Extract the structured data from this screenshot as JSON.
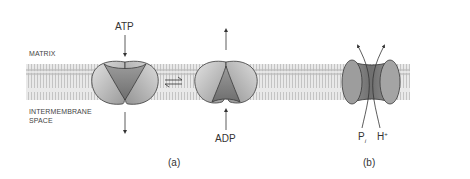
{
  "labels": {
    "matrix": "MATRIX",
    "intermembrane_line1": "INTERMEMBRANE",
    "intermembrane_line2": "SPACE",
    "atp": "ATP",
    "adp": "ADP",
    "pi_main": "P",
    "pi_sub": "i",
    "h_main": "H",
    "h_sup": "+",
    "panel_a": "(a)",
    "panel_b": "(b)"
  },
  "colors": {
    "membrane": "#cfcfcf",
    "protein_light": "#d6d6d6",
    "protein_dark": "#7a7a7a",
    "outline": "#3a3a3a"
  }
}
